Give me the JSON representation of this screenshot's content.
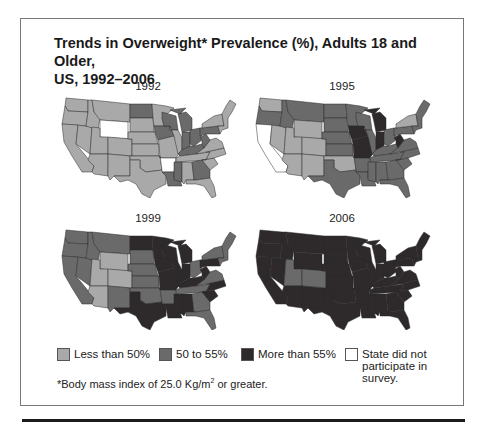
{
  "title_line1": "Trends in Overweight* Prevalence (%), Adults 18 and Older,",
  "title_line2": "US, 1992–2006",
  "colors": {
    "low": "#a9a9a9",
    "mid": "#6a6a6a",
    "high": "#2e2a2c",
    "none": "#ffffff"
  },
  "legend": [
    {
      "key": "low",
      "label": "Less than 50%"
    },
    {
      "key": "mid",
      "label": "50 to 55%"
    },
    {
      "key": "high",
      "label": "More than 55%"
    },
    {
      "key": "none",
      "label": "State did not participate in survey."
    }
  ],
  "footnote_prefix": "*Body mass index of 25.0 Kg/m",
  "footnote_sup": "2",
  "footnote_suffix": " or greater.",
  "maps": [
    {
      "year": "1992"
    },
    {
      "year": "1995"
    },
    {
      "year": "1999"
    },
    {
      "year": "2006"
    }
  ],
  "chart_data": {
    "type": "choropleth",
    "title": "Trends in Overweight* Prevalence (%), Adults 18 and Older, US, 1992–2006",
    "legend_categories": [
      "Less than 50%",
      "50 to 55%",
      "More than 55%",
      "State did not participate in survey"
    ],
    "footnote": "*Body mass index of 25.0 Kg/m2 or greater.",
    "years": [
      "1992",
      "1995",
      "1999",
      "2006"
    ],
    "state_categories": {
      "1992": {
        "WA": "low",
        "OR": "low",
        "CA": "low",
        "NV": "low",
        "ID": "low",
        "MT": "low",
        "WY": "none",
        "UT": "low",
        "AZ": "low",
        "CO": "low",
        "NM": "low",
        "ND": "mid",
        "SD": "low",
        "NE": "low",
        "KS": "low",
        "OK": "low",
        "TX": "low",
        "MN": "low",
        "IA": "mid",
        "MO": "low",
        "AR": "none",
        "LA": "mid",
        "WI": "mid",
        "IL": "low",
        "MI": "mid",
        "IN": "mid",
        "OH": "mid",
        "KY": "mid",
        "TN": "low",
        "MS": "mid",
        "AL": "low",
        "GA": "mid",
        "FL": "low",
        "SC": "low",
        "NC": "low",
        "VA": "low",
        "WV": "mid",
        "PA": "mid",
        "NY": "low",
        "NE_states": "low"
      },
      "1995": {
        "WA": "low",
        "OR": "mid",
        "CA": "none",
        "NV": "low",
        "ID": "mid",
        "MT": "mid",
        "WY": "low",
        "UT": "low",
        "AZ": "low",
        "CO": "low",
        "NM": "low",
        "ND": "mid",
        "SD": "mid",
        "NE": "mid",
        "KS": "mid",
        "OK": "low",
        "TX": "mid",
        "MN": "mid",
        "IA": "high",
        "MO": "high",
        "AR": "mid",
        "LA": "mid",
        "WI": "mid",
        "IL": "mid",
        "MI": "high",
        "IN": "high",
        "OH": "mid",
        "KY": "mid",
        "TN": "mid",
        "MS": "mid",
        "AL": "mid",
        "GA": "mid",
        "FL": "mid",
        "SC": "mid",
        "NC": "mid",
        "VA": "mid",
        "WV": "high",
        "PA": "mid",
        "NY": "low",
        "NE_states": "mid"
      },
      "1999": {
        "WA": "mid",
        "OR": "mid",
        "CA": "mid",
        "NV": "mid",
        "ID": "mid",
        "MT": "mid",
        "WY": "low",
        "UT": "low",
        "AZ": "low",
        "CO": "low",
        "NM": "mid",
        "ND": "high",
        "SD": "mid",
        "NE": "mid",
        "KS": "mid",
        "OK": "mid",
        "TX": "high",
        "MN": "high",
        "IA": "high",
        "MO": "high",
        "AR": "mid",
        "LA": "high",
        "WI": "high",
        "IL": "high",
        "MI": "high",
        "IN": "high",
        "OH": "mid",
        "KY": "high",
        "TN": "mid",
        "MS": "high",
        "AL": "high",
        "GA": "mid",
        "FL": "mid",
        "SC": "high",
        "NC": "high",
        "VA": "mid",
        "WV": "high",
        "PA": "high",
        "NY": "mid",
        "NE_states": "mid"
      },
      "2006": {
        "WA": "high",
        "OR": "high",
        "CA": "high",
        "NV": "high",
        "ID": "high",
        "MT": "high",
        "WY": "high",
        "UT": "mid",
        "AZ": "high",
        "CO": "mid",
        "NM": "high",
        "ND": "high",
        "SD": "high",
        "NE": "high",
        "KS": "high",
        "OK": "high",
        "TX": "high",
        "MN": "high",
        "IA": "high",
        "MO": "high",
        "AR": "high",
        "LA": "high",
        "WI": "high",
        "IL": "high",
        "MI": "high",
        "IN": "high",
        "OH": "high",
        "KY": "high",
        "TN": "high",
        "MS": "high",
        "AL": "high",
        "GA": "high",
        "FL": "high",
        "SC": "high",
        "NC": "high",
        "VA": "high",
        "WV": "high",
        "PA": "high",
        "NY": "high",
        "NE_states": "high"
      }
    }
  }
}
